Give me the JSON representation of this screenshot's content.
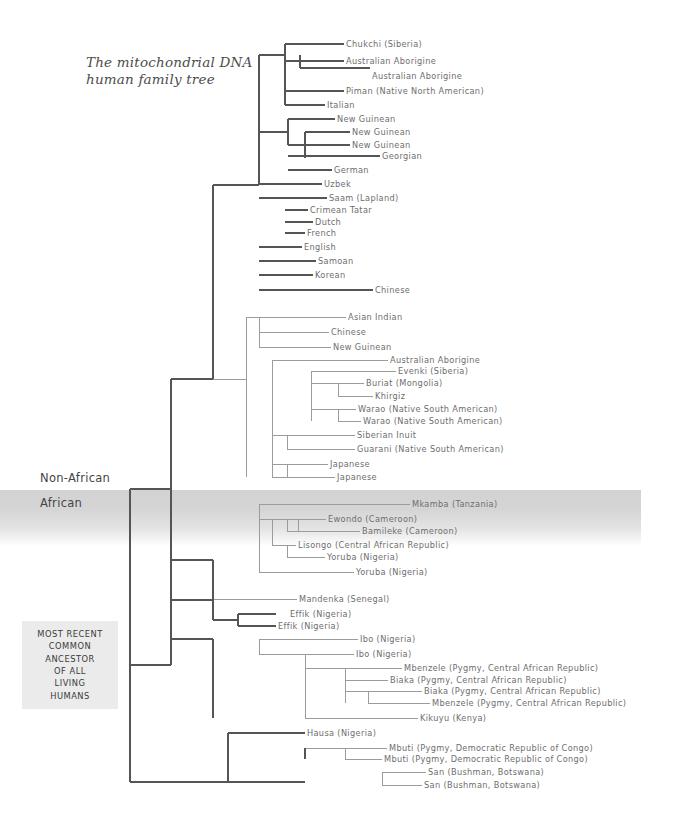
{
  "title": {
    "line1": "The mitochondrial DNA",
    "line2": "human family tree"
  },
  "region_labels": {
    "non_african": "Non-African",
    "african": "African"
  },
  "mrca": {
    "lines": [
      "MOST RECENT",
      "COMMON",
      "ANCESTOR",
      "OF ALL",
      "LIVING",
      "HUMANS"
    ]
  },
  "colors": {
    "background": "#ffffff",
    "line_dark": "#555555",
    "line_light": "#9b9b9b",
    "text_label": "#6e6e6e",
    "band_shade": "#d2d2d2",
    "mrca_box": "#ebebeb"
  },
  "tips": [
    {
      "label": "Chukchi (Siberia)",
      "x": 346,
      "y": 44,
      "tone": "light"
    },
    {
      "label": "Australian Aborigine",
      "x": 346,
      "y": 61,
      "tone": "light"
    },
    {
      "label": "Australian Aborigine",
      "x": 372,
      "y": 76,
      "tone": "light"
    },
    {
      "label": "Piman (Native North American)",
      "x": 346,
      "y": 91,
      "tone": "light"
    },
    {
      "label": "Italian",
      "x": 327,
      "y": 105,
      "tone": "light"
    },
    {
      "label": "New Guinean",
      "x": 337,
      "y": 119,
      "tone": "light"
    },
    {
      "label": "New Guinean",
      "x": 352,
      "y": 132,
      "tone": "light"
    },
    {
      "label": "New Guinean",
      "x": 352,
      "y": 145,
      "tone": "light"
    },
    {
      "label": "Georgian",
      "x": 382,
      "y": 156,
      "tone": "light"
    },
    {
      "label": "German",
      "x": 334,
      "y": 170,
      "tone": "light"
    },
    {
      "label": "Uzbek",
      "x": 324,
      "y": 184,
      "tone": "light"
    },
    {
      "label": "Saam (Lapland)",
      "x": 329,
      "y": 198,
      "tone": "light"
    },
    {
      "label": "Crimean Tatar",
      "x": 310,
      "y": 210,
      "tone": "light"
    },
    {
      "label": "Dutch",
      "x": 315,
      "y": 222,
      "tone": "light"
    },
    {
      "label": "French",
      "x": 307,
      "y": 233,
      "tone": "light"
    },
    {
      "label": "English",
      "x": 304,
      "y": 247,
      "tone": "light"
    },
    {
      "label": "Samoan",
      "x": 318,
      "y": 261,
      "tone": "light"
    },
    {
      "label": "Korean",
      "x": 315,
      "y": 275,
      "tone": "light"
    },
    {
      "label": "Chinese",
      "x": 375,
      "y": 290,
      "tone": "light"
    },
    {
      "label": "Asian Indian",
      "x": 348,
      "y": 317,
      "tone": "light"
    },
    {
      "label": "Chinese",
      "x": 331,
      "y": 332,
      "tone": "light"
    },
    {
      "label": "New Guinean",
      "x": 333,
      "y": 347,
      "tone": "light"
    },
    {
      "label": "Australian Aborigine",
      "x": 390,
      "y": 360,
      "tone": "light"
    },
    {
      "label": "Evenki (Siberia)",
      "x": 398,
      "y": 371,
      "tone": "light"
    },
    {
      "label": "Buriat (Mongolia)",
      "x": 366,
      "y": 383,
      "tone": "light"
    },
    {
      "label": "Khirgiz",
      "x": 375,
      "y": 396,
      "tone": "light"
    },
    {
      "label": "Warao (Native South American)",
      "x": 358,
      "y": 409,
      "tone": "light"
    },
    {
      "label": "Warao (Native South American)",
      "x": 363,
      "y": 421,
      "tone": "light"
    },
    {
      "label": "Siberian Inuit",
      "x": 357,
      "y": 435,
      "tone": "light"
    },
    {
      "label": "Guarani (Native South American)",
      "x": 357,
      "y": 449,
      "tone": "light"
    },
    {
      "label": "Japanese",
      "x": 330,
      "y": 464,
      "tone": "light"
    },
    {
      "label": "Japanese",
      "x": 337,
      "y": 477,
      "tone": "light"
    },
    {
      "label": "Mkamba (Tanzania)",
      "x": 412,
      "y": 504,
      "tone": "light"
    },
    {
      "label": "Ewondo (Cameroon)",
      "x": 328,
      "y": 519,
      "tone": "light"
    },
    {
      "label": "Bamileke (Cameroon)",
      "x": 362,
      "y": 531,
      "tone": "light"
    },
    {
      "label": "Lisongo (Central African Republic)",
      "x": 298,
      "y": 545,
      "tone": "light"
    },
    {
      "label": "Yoruba (Nigeria)",
      "x": 327,
      "y": 557,
      "tone": "light"
    },
    {
      "label": "Yoruba (Nigeria)",
      "x": 356,
      "y": 572,
      "tone": "light"
    },
    {
      "label": "Mandenka (Senegal)",
      "x": 299,
      "y": 599,
      "tone": "light"
    },
    {
      "label": "Effik (Nigeria)",
      "x": 290,
      "y": 614,
      "tone": "light"
    },
    {
      "label": "Effik (Nigeria)",
      "x": 278,
      "y": 626,
      "tone": "light"
    },
    {
      "label": "Ibo (Nigeria)",
      "x": 360,
      "y": 639,
      "tone": "light"
    },
    {
      "label": "Ibo (Nigeria)",
      "x": 356,
      "y": 654,
      "tone": "light"
    },
    {
      "label": "Mbenzele (Pygmy, Central African Republic)",
      "x": 404,
      "y": 668,
      "tone": "light"
    },
    {
      "label": "Biaka (Pygmy, Central African Republic)",
      "x": 390,
      "y": 680,
      "tone": "light"
    },
    {
      "label": "Biaka (Pygmy, Central African Republic)",
      "x": 424,
      "y": 691,
      "tone": "light"
    },
    {
      "label": "Mbenzele (Pygmy, Central African Republic)",
      "x": 432,
      "y": 703,
      "tone": "light"
    },
    {
      "label": "Kikuyu (Kenya)",
      "x": 420,
      "y": 718,
      "tone": "light"
    },
    {
      "label": "Hausa (Nigeria)",
      "x": 307,
      "y": 733,
      "tone": "light"
    },
    {
      "label": "Mbuti (Pygmy, Democratic Republic of Congo)",
      "x": 389,
      "y": 748,
      "tone": "light"
    },
    {
      "label": "Mbuti (Pygmy, Democratic Republic of Congo)",
      "x": 384,
      "y": 759,
      "tone": "light"
    },
    {
      "label": "San (Bushman, Botswana)",
      "x": 428,
      "y": 772,
      "tone": "light"
    },
    {
      "label": "San (Bushman, Botswana)",
      "x": 424,
      "y": 785,
      "tone": "light"
    }
  ],
  "chart_data": {
    "type": "tree",
    "title": "The mitochondrial DNA human family tree",
    "orientation": "left-to-right-cladogram",
    "root": {
      "x": 130,
      "y": 665
    },
    "groups": {
      "non_african_count": 32,
      "african_count": 22,
      "total_tips": 54
    },
    "segments_dark": [
      [
        130,
        665,
        130,
        489
      ],
      [
        130,
        489,
        171,
        489
      ],
      [
        171,
        489,
        171,
        600
      ],
      [
        171,
        600,
        213,
        600
      ],
      [
        213,
        600,
        213,
        620
      ],
      [
        213,
        620,
        238,
        620
      ],
      [
        238,
        614,
        238,
        626
      ],
      [
        238,
        614,
        276,
        614
      ],
      [
        238,
        626,
        276,
        626
      ],
      [
        213,
        560,
        213,
        600
      ],
      [
        130,
        665,
        130,
        782
      ],
      [
        130,
        782,
        228,
        782
      ],
      [
        228,
        733,
        228,
        782
      ],
      [
        228,
        733,
        305,
        733
      ],
      [
        228,
        782,
        305,
        782
      ],
      [
        171,
        489,
        171,
        379
      ],
      [
        171,
        379,
        213,
        379
      ],
      [
        213,
        185,
        213,
        379
      ],
      [
        213,
        185,
        259,
        185
      ],
      [
        259,
        55,
        259,
        185
      ],
      [
        259,
        55,
        285,
        55
      ],
      [
        285,
        44,
        285,
        105
      ],
      [
        285,
        44,
        344,
        44
      ],
      [
        285,
        61,
        300,
        61
      ],
      [
        300,
        55,
        300,
        68
      ],
      [
        300,
        61,
        344,
        61
      ],
      [
        300,
        68,
        370,
        68
      ],
      [
        285,
        91,
        344,
        91
      ],
      [
        285,
        105,
        325,
        105
      ],
      [
        259,
        132,
        259,
        185
      ],
      [
        259,
        132,
        288,
        132
      ],
      [
        288,
        119,
        288,
        145
      ],
      [
        288,
        119,
        335,
        119
      ],
      [
        288,
        145,
        305,
        145
      ],
      [
        305,
        132,
        305,
        158
      ],
      [
        305,
        132,
        350,
        132
      ],
      [
        305,
        145,
        350,
        145
      ],
      [
        288,
        156,
        380,
        156
      ],
      [
        288,
        170,
        332,
        170
      ],
      [
        259,
        184,
        322,
        184
      ],
      [
        259,
        198,
        327,
        198
      ],
      [
        285,
        210,
        308,
        210
      ],
      [
        285,
        222,
        313,
        222
      ],
      [
        285,
        233,
        305,
        233
      ],
      [
        259,
        247,
        302,
        247
      ],
      [
        259,
        261,
        316,
        261
      ],
      [
        259,
        275,
        313,
        275
      ],
      [
        259,
        290,
        373,
        290
      ]
    ],
    "segments_light": [
      [
        259,
        317,
        346,
        317
      ],
      [
        259,
        332,
        329,
        332
      ],
      [
        259,
        347,
        331,
        347
      ],
      [
        272,
        360,
        388,
        360
      ],
      [
        311,
        371,
        396,
        371
      ],
      [
        338,
        383,
        364,
        383
      ],
      [
        338,
        396,
        373,
        396
      ],
      [
        338,
        409,
        356,
        409
      ],
      [
        338,
        421,
        361,
        421
      ],
      [
        287,
        435,
        355,
        435
      ],
      [
        287,
        449,
        355,
        449
      ],
      [
        272,
        464,
        328,
        464
      ],
      [
        272,
        477,
        335,
        477
      ],
      [
        259,
        504,
        410,
        504
      ],
      [
        287,
        519,
        326,
        519
      ],
      [
        298,
        531,
        360,
        531
      ],
      [
        272,
        545,
        296,
        545
      ],
      [
        287,
        557,
        325,
        557
      ],
      [
        259,
        572,
        354,
        572
      ],
      [
        213,
        599,
        297,
        599
      ],
      [
        259,
        639,
        358,
        639
      ],
      [
        305,
        654,
        354,
        654
      ],
      [
        345,
        668,
        402,
        668
      ],
      [
        345,
        680,
        388,
        680
      ],
      [
        368,
        691,
        422,
        691
      ],
      [
        368,
        703,
        430,
        703
      ],
      [
        305,
        718,
        418,
        718
      ],
      [
        345,
        748,
        387,
        748
      ],
      [
        345,
        759,
        382,
        759
      ],
      [
        382,
        772,
        426,
        772
      ],
      [
        382,
        785,
        422,
        785
      ]
    ]
  }
}
